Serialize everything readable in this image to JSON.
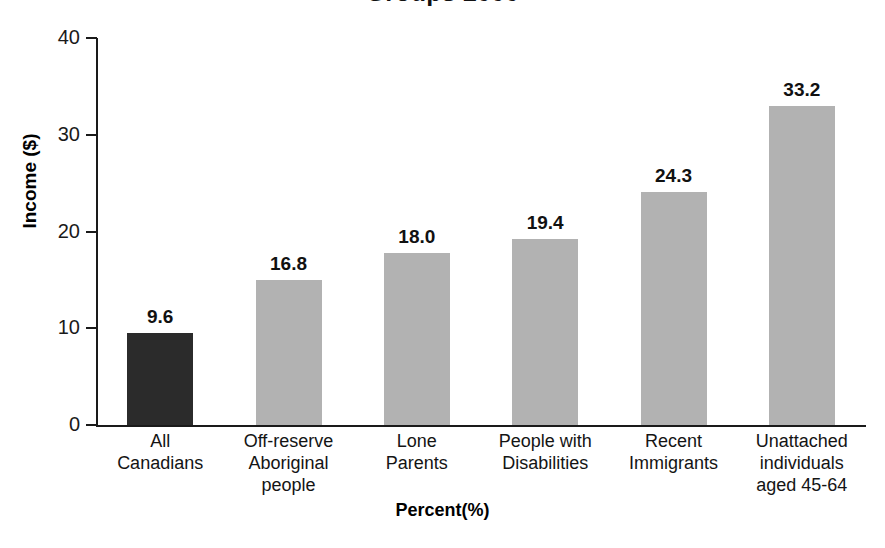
{
  "chart_data": {
    "type": "bar",
    "title": "Groups 2000",
    "xlabel": "Percent(%)",
    "ylabel": "Income ($)",
    "categories": [
      "All Canadians",
      "Off-reserve Aboriginal people",
      "Lone Parents",
      "People with Disabilities",
      "Recent Immigrants",
      "Unattached individuals aged 45-64"
    ],
    "category_lines": [
      [
        "All",
        "Canadians"
      ],
      [
        "Off-reserve",
        "Aboriginal",
        "people"
      ],
      [
        "Lone",
        "Parents"
      ],
      [
        "People with",
        "Disabilities"
      ],
      [
        "Recent",
        "Immigrants"
      ],
      [
        "Unattached",
        "individuals",
        "aged 45-64"
      ]
    ],
    "values": [
      9.6,
      16.8,
      18.0,
      19.4,
      24.3,
      33.2
    ],
    "value_labels": [
      "9.6",
      "16.8",
      "18.0",
      "19.4",
      "24.3",
      "33.2"
    ],
    "bar_heights": [
      9.5,
      15.0,
      17.8,
      19.2,
      24.1,
      33.0
    ],
    "bar_colors": [
      "#2b2b2b",
      "#b2b2b2",
      "#b2b2b2",
      "#b2b2b2",
      "#b2b2b2",
      "#b2b2b2"
    ],
    "ylim": [
      0,
      40
    ],
    "yticks": [
      0,
      10,
      20,
      30,
      40
    ],
    "ytick_labels": [
      "0",
      "10",
      "20",
      "30",
      "40"
    ],
    "grid": false,
    "legend": "none",
    "axis_color": "#1a1a1a",
    "highlight_color": "#2b2b2b",
    "series_color": "#b2b2b2"
  }
}
